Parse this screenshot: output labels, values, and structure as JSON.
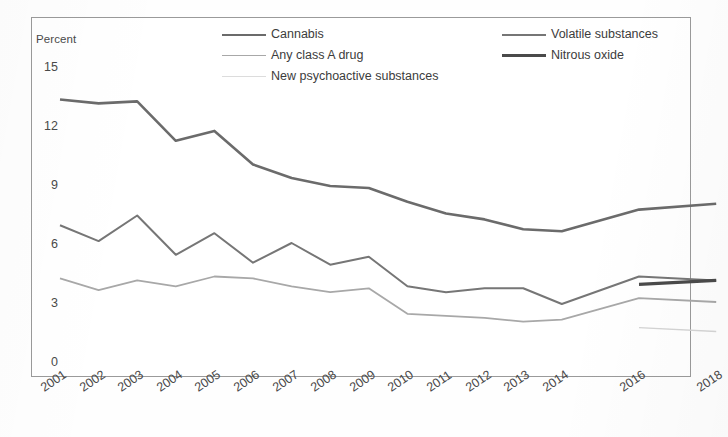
{
  "chart_data": {
    "type": "line",
    "title": "",
    "xlabel": "",
    "ylabel": "Percent",
    "ylim": [
      0,
      15
    ],
    "yticks": [
      0,
      3,
      6,
      9,
      12,
      15
    ],
    "grid": false,
    "legend_position": "top",
    "categories": [
      "2001",
      "2002",
      "2003",
      "2004",
      "2005",
      "2006",
      "2007",
      "2008",
      "2009",
      "2010",
      "2011",
      "2012",
      "2013",
      "2014",
      "2016",
      "2018"
    ],
    "series": [
      {
        "name": "Cannabis",
        "color": "#6b6b6b",
        "values": [
          13.4,
          13.2,
          13.3,
          11.3,
          11.8,
          10.1,
          9.4,
          9.0,
          8.9,
          8.2,
          7.6,
          7.3,
          6.8,
          6.7,
          7.8,
          8.1
        ]
      },
      {
        "name": "Volatile substances",
        "color": "#767676",
        "values": [
          7.0,
          6.2,
          7.5,
          5.5,
          6.6,
          5.1,
          6.1,
          5.0,
          5.4,
          3.9,
          3.6,
          3.8,
          3.8,
          3.0,
          4.4,
          4.2
        ]
      },
      {
        "name": "Any class A drug",
        "color": "#a8a8a8",
        "values": [
          4.3,
          3.7,
          4.2,
          3.9,
          4.4,
          4.3,
          3.9,
          3.6,
          3.8,
          2.5,
          2.4,
          2.3,
          2.1,
          2.2,
          3.3,
          3.1
        ]
      },
      {
        "name": "Nitrous oxide",
        "color": "#4a4a4a",
        "values": [
          null,
          null,
          null,
          null,
          null,
          null,
          null,
          null,
          null,
          null,
          null,
          null,
          null,
          null,
          4.0,
          4.2
        ]
      },
      {
        "name": "New psychoactive substances",
        "color": "#d4d4d4",
        "values": [
          null,
          null,
          null,
          null,
          null,
          null,
          null,
          null,
          null,
          null,
          null,
          null,
          null,
          null,
          1.8,
          1.6
        ]
      }
    ]
  },
  "axis": {
    "ylabel": "Percent",
    "ytick_labels": [
      "15",
      "12",
      "9",
      "6",
      "3",
      "0"
    ],
    "xtick_labels": [
      "2001",
      "2002",
      "2003",
      "2004",
      "2005",
      "2006",
      "2007",
      "2008",
      "2009",
      "2010",
      "2011",
      "2012",
      "2013",
      "2014",
      "2016",
      "2018"
    ]
  },
  "legend": {
    "left_column": [
      {
        "label": "Cannabis",
        "color": "#6b6b6b",
        "width": "2.6px"
      },
      {
        "label": "Any class A drug",
        "color": "#a8a8a8",
        "width": "1.8px"
      },
      {
        "label": "New psychoactive substances",
        "color": "#dcdcdc",
        "width": "1.4px"
      }
    ],
    "right_column": [
      {
        "label": "Volatile substances",
        "color": "#767676",
        "width": "2.0px"
      },
      {
        "label": "Nitrous oxide",
        "color": "#4a4a4a",
        "width": "3.2px"
      }
    ]
  }
}
